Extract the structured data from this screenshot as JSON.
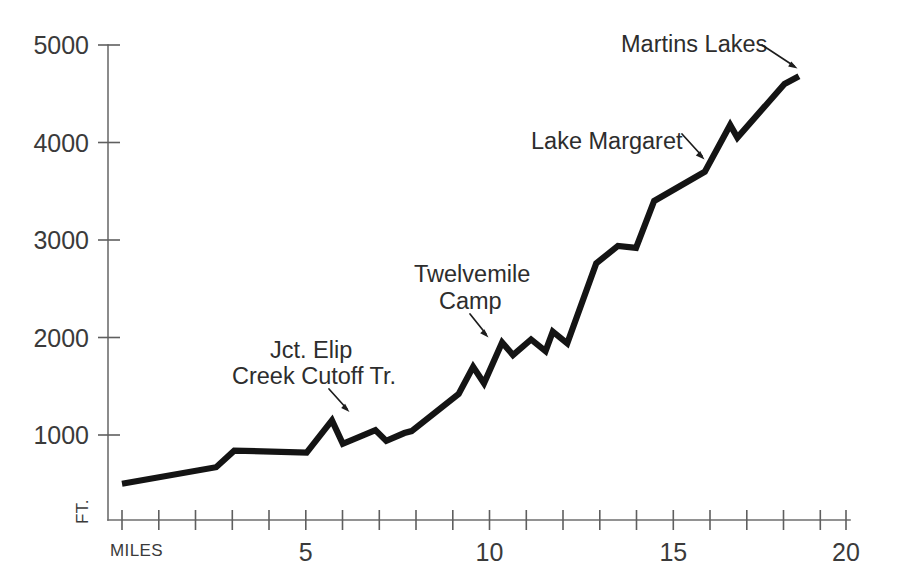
{
  "chart_data": {
    "type": "line",
    "title": "",
    "subtitle": "",
    "xlabel": "MILES",
    "ylabel": "FT.",
    "xlim": [
      0,
      20
    ],
    "ylim": [
      0,
      5000
    ],
    "grid": false,
    "legend_position": "none",
    "x_tick_labels": [
      "5",
      "10",
      "15",
      "20"
    ],
    "x_tick_values": [
      5,
      10,
      15,
      20
    ],
    "x_minor_tick_values": [
      0,
      1,
      2,
      3,
      4,
      6,
      7,
      8,
      9,
      11,
      12,
      13,
      14,
      16,
      17,
      18,
      19
    ],
    "y_tick_labels": [
      "1000",
      "2000",
      "3000",
      "4000",
      "5000"
    ],
    "y_tick_values": [
      1000,
      2000,
      3000,
      4000,
      5000
    ],
    "series": [
      {
        "name": "Trail elevation profile",
        "x": [
          0.0,
          2.6,
          3.1,
          5.1,
          5.8,
          6.1,
          7.0,
          7.3,
          7.8,
          8.0,
          9.3,
          9.7,
          10.0,
          10.5,
          10.8,
          11.3,
          11.7,
          11.9,
          12.3,
          13.1,
          13.7,
          14.2,
          14.7,
          16.1,
          16.8,
          17.0,
          18.3,
          18.7
        ],
        "y": [
          500,
          670,
          840,
          820,
          1150,
          910,
          1050,
          940,
          1020,
          1040,
          1420,
          1700,
          1530,
          1950,
          1820,
          1980,
          1860,
          2060,
          1940,
          2760,
          2940,
          2920,
          3400,
          3700,
          4180,
          4050,
          4600,
          4680
        ],
        "units": "feet"
      }
    ],
    "annotations": [
      {
        "id": "jct-elip-creek-cutoff",
        "lines": [
          "Jct. Elip",
          "Creek Cutoff Tr."
        ],
        "target_mile": 6.2,
        "target_elevation": 1100
      },
      {
        "id": "twelvemile-camp",
        "lines": [
          "Twelvemile",
          "Camp"
        ],
        "target_mile": 10.2,
        "target_elevation": 1900
      },
      {
        "id": "lake-margaret",
        "lines": [
          "Lake Margaret"
        ],
        "target_mile": 16.1,
        "target_elevation": 3700
      },
      {
        "id": "martins-lakes",
        "lines": [
          "Martins Lakes"
        ],
        "target_mile": 18.6,
        "target_elevation": 4660
      }
    ]
  },
  "axes": {
    "y_labels": {
      "t1000": "1000",
      "t2000": "2000",
      "t3000": "3000",
      "t4000": "4000",
      "t5000": "5000"
    },
    "x_labels": {
      "t5": "5",
      "t10": "10",
      "t15": "15",
      "t20": "20"
    },
    "unit_y": "FT.",
    "unit_x": "MILES"
  },
  "annotations_text": {
    "jct_line1": "Jct. Elip",
    "jct_line2": "Creek Cutoff Tr.",
    "twelvemile_line1": "Twelvemile",
    "twelvemile_line2": "Camp",
    "lake_margaret": "Lake Margaret",
    "martins_lakes": "Martins Lakes"
  },
  "colors": {
    "background": "#ffffff",
    "profile_line": "#141414",
    "axis": "#6e6e6e",
    "text": "#2d2d2d"
  }
}
